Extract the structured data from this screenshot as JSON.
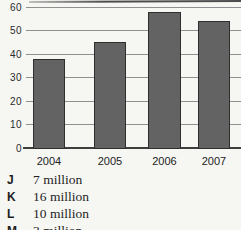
{
  "figure": {
    "background_color": "#f6f6f3",
    "top_rule_color": "#4c4c4c"
  },
  "chart_data": {
    "type": "bar",
    "categories": [
      "2004",
      "2005",
      "2006",
      "2007"
    ],
    "values": [
      38,
      45,
      58,
      54
    ],
    "title": "",
    "xlabel": "",
    "ylabel": "",
    "ylim": [
      0,
      60
    ],
    "yticks": [
      0,
      10,
      20,
      30,
      40,
      50,
      60
    ],
    "grid": true,
    "legend": false,
    "bar_color": "#636363",
    "bar_border_color": "#2f2f2f",
    "gridline_color": "#8f8f8f",
    "axis_color": "#3e3e3e",
    "tick_label_color": "#2b2b2b"
  },
  "answers": {
    "options": [
      {
        "letter": "J",
        "text": "7 million"
      },
      {
        "letter": "K",
        "text": "16 million"
      },
      {
        "letter": "L",
        "text": "10 million"
      },
      {
        "letter": "M",
        "text": "3 million",
        "note": "clipped at bottom edge of image"
      }
    ]
  }
}
